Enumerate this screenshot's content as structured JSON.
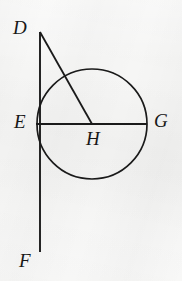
{
  "figure": {
    "kind": "plane-geometry-diagram",
    "width": 182,
    "height": 281,
    "background_color": "#f6f6f5",
    "stroke_color": "#1a1a1a",
    "label_color": "#171717"
  },
  "labels": {
    "D": "D",
    "E": "E",
    "F": "F",
    "G": "G",
    "H": "H"
  },
  "points": {
    "D": {
      "x": 40,
      "y": 32
    },
    "E": {
      "x": 36,
      "y": 124
    },
    "F": {
      "x": 40,
      "y": 252
    },
    "G": {
      "x": 147,
      "y": 124
    },
    "H": {
      "x": 92,
      "y": 124
    }
  },
  "circle": {
    "center": {
      "x": 92,
      "y": 124
    },
    "radius": 55,
    "center_label": "H"
  },
  "segments": [
    {
      "name": "line-DF",
      "from": "D",
      "to": "F",
      "x1": 40,
      "y1": 32,
      "x2": 40,
      "y2": 252
    },
    {
      "name": "line-EG",
      "from": "E",
      "to": "G",
      "x1": 36,
      "y1": 124,
      "x2": 147,
      "y2": 124
    },
    {
      "name": "line-DH",
      "from": "D",
      "to": "H",
      "x1": 40,
      "y1": 32,
      "x2": 92,
      "y2": 124
    }
  ]
}
